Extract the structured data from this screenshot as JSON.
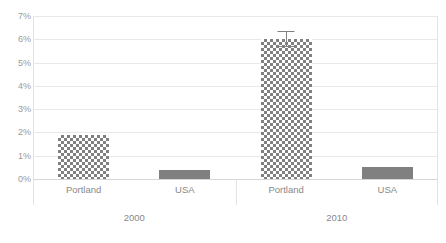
{
  "chart_data": {
    "type": "bar",
    "title": "",
    "subtitle": "",
    "xlabel": "",
    "ylabel": "",
    "ylim": [
      0,
      7
    ],
    "ytick_labels": [
      "0%",
      "1%",
      "2%",
      "3%",
      "4%",
      "5%",
      "6%",
      "7%"
    ],
    "ytick_values": [
      0,
      1,
      2,
      3,
      4,
      5,
      6,
      7
    ],
    "grid": true,
    "legend": false,
    "legend_position": "none",
    "categories": [
      "Portland",
      "USA",
      "Portland",
      "USA"
    ],
    "groups": [
      {
        "label": "2000",
        "categories": [
          "Portland",
          "USA"
        ]
      },
      {
        "label": "2010",
        "categories": [
          "Portland",
          "USA"
        ]
      }
    ],
    "values": [
      1.9,
      0.4,
      6.0,
      0.5
    ],
    "bars": [
      {
        "category": "Portland",
        "group": "2000",
        "value": 1.9,
        "fill": "checker",
        "error": null
      },
      {
        "category": "USA",
        "group": "2000",
        "value": 0.4,
        "fill": "solid",
        "error": null
      },
      {
        "category": "Portland",
        "group": "2010",
        "value": 6.0,
        "fill": "checker",
        "error": 0.35
      },
      {
        "category": "USA",
        "group": "2010",
        "value": 0.5,
        "fill": "solid",
        "error": null
      }
    ]
  },
  "colors": {
    "bar_fill": "#808080",
    "gridline": "#e9e9e9",
    "baseline": "#d6d6d6",
    "frame": "#e3e3e3",
    "tick_text": "#9a9a9a",
    "label_text": "#888888",
    "background": "#ffffff"
  }
}
